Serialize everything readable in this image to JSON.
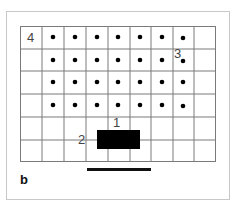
{
  "figure": {
    "panel_letter": "b",
    "grid": {
      "columns": 9,
      "rows": 6,
      "line_color": "#7a7a7a",
      "dot_color": "#000000",
      "dot_rows": [
        0,
        1,
        2,
        3
      ],
      "dot_columns": [
        1,
        2,
        3,
        4,
        5,
        6,
        7
      ]
    },
    "labels": [
      {
        "id": "label-1",
        "text": "1"
      },
      {
        "id": "label-2",
        "text": "2"
      },
      {
        "id": "label-3",
        "text": "3"
      },
      {
        "id": "label-4",
        "text": "4"
      }
    ],
    "block_color": "#000000",
    "scale_bar_color": "#111111"
  }
}
